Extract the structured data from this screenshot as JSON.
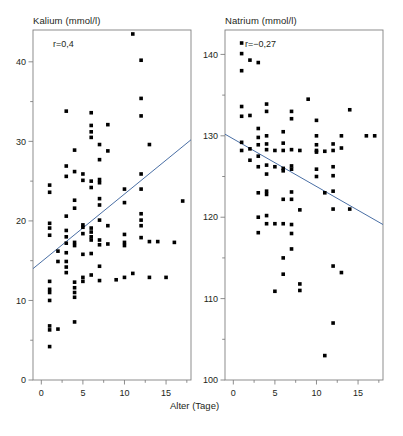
{
  "figure": {
    "width": 403,
    "height": 436,
    "background": "#ffffff",
    "marker_color": "#000000",
    "line_color": "#4a6fa5",
    "frame_color": "#808080",
    "text_color": "#231f20",
    "shared_xlabel": "Alter (Tage)"
  },
  "chart_data": [
    {
      "type": "scatter",
      "title": "Kalium (mmol/l)",
      "xlabel": "Alter (Tage)",
      "ylabel": "Kalium (mmol/l)",
      "annotation": "r=0,4",
      "correlation": 0.4,
      "xlim": [
        -1,
        18
      ],
      "ylim": [
        0,
        44
      ],
      "xticks": [
        0,
        5,
        10,
        15
      ],
      "xticklabels": [
        "0",
        "5",
        "10",
        "15"
      ],
      "xminorticks": [
        2.5,
        7.5,
        12.5,
        17.5
      ],
      "yticks": [
        0,
        10,
        20,
        30,
        40
      ],
      "yticklabels": [
        "0",
        "10",
        "20",
        "30",
        "40"
      ],
      "yminorticks": [
        5,
        15,
        25,
        35
      ],
      "grid": false,
      "legend": "none",
      "trendline": {
        "x0": -1,
        "y0": 14.0,
        "x1": 18,
        "y1": 30.2
      },
      "points": [
        [
          1,
          4.2
        ],
        [
          1,
          6.3
        ],
        [
          1,
          6.8
        ],
        [
          1,
          10.0
        ],
        [
          1,
          11.0
        ],
        [
          1,
          11.4
        ],
        [
          1,
          12.4
        ],
        [
          1,
          18.2
        ],
        [
          1,
          19.1
        ],
        [
          1,
          19.7
        ],
        [
          1,
          23.6
        ],
        [
          1,
          24.5
        ],
        [
          2,
          6.4
        ],
        [
          2,
          14.9
        ],
        [
          2,
          16.2
        ],
        [
          3,
          13.5
        ],
        [
          3,
          14.2
        ],
        [
          3,
          14.9
        ],
        [
          3,
          16.0
        ],
        [
          3,
          17.2
        ],
        [
          3,
          18.0
        ],
        [
          3,
          18.8
        ],
        [
          3,
          20.6
        ],
        [
          3,
          25.6
        ],
        [
          3,
          26.9
        ],
        [
          3,
          33.8
        ],
        [
          4,
          7.3
        ],
        [
          4,
          10.4
        ],
        [
          4,
          11.0
        ],
        [
          4,
          11.6
        ],
        [
          4,
          12.3
        ],
        [
          4,
          16.9
        ],
        [
          4,
          17.3
        ],
        [
          4,
          21.6
        ],
        [
          4,
          22.6
        ],
        [
          4,
          26.2
        ],
        [
          4,
          28.9
        ],
        [
          5,
          12.4
        ],
        [
          5,
          12.9
        ],
        [
          5,
          15.8
        ],
        [
          5,
          18.4
        ],
        [
          5,
          19.2
        ],
        [
          5,
          19.5
        ],
        [
          5,
          25.1
        ],
        [
          5,
          25.9
        ],
        [
          6,
          13.2
        ],
        [
          6,
          15.9
        ],
        [
          6,
          17.6
        ],
        [
          6,
          18.0
        ],
        [
          6,
          18.6
        ],
        [
          6,
          19.1
        ],
        [
          6,
          24.2
        ],
        [
          6,
          25.0
        ],
        [
          6,
          33.6
        ],
        [
          6,
          31.2
        ],
        [
          6,
          32.0
        ],
        [
          6,
          30.5
        ],
        [
          7,
          12.5
        ],
        [
          7,
          14.3
        ],
        [
          7,
          17.0
        ],
        [
          7,
          17.6
        ],
        [
          7,
          20.1
        ],
        [
          7,
          22.0
        ],
        [
          7,
          22.8
        ],
        [
          7,
          24.8
        ],
        [
          7,
          25.2
        ],
        [
          7,
          27.7
        ],
        [
          7,
          29.6
        ],
        [
          8,
          17.1
        ],
        [
          8,
          19.4
        ],
        [
          8,
          28.8
        ],
        [
          8,
          32.1
        ],
        [
          9,
          12.6
        ],
        [
          10,
          12.9
        ],
        [
          10,
          16.9
        ],
        [
          10,
          17.3
        ],
        [
          10,
          18.3
        ],
        [
          10,
          22.3
        ],
        [
          10,
          24.0
        ],
        [
          11,
          13.4
        ],
        [
          11,
          43.5
        ],
        [
          12,
          17.9
        ],
        [
          12,
          19.4
        ],
        [
          12,
          20.1
        ],
        [
          12,
          20.9
        ],
        [
          12,
          24.0
        ],
        [
          12,
          25.9
        ],
        [
          12,
          33.2
        ],
        [
          12,
          35.4
        ],
        [
          12,
          40.2
        ],
        [
          13,
          12.9
        ],
        [
          13,
          17.4
        ],
        [
          13,
          29.6
        ],
        [
          14,
          17.4
        ],
        [
          15,
          12.9
        ],
        [
          16,
          17.3
        ],
        [
          17,
          22.5
        ]
      ]
    },
    {
      "type": "scatter",
      "title": "Natrium (mmol/l)",
      "xlabel": "Alter (Tage)",
      "ylabel": "Natrium (mmol/l)",
      "annotation": "r=−0,27",
      "correlation": -0.27,
      "xlim": [
        -1,
        18
      ],
      "ylim": [
        100,
        143
      ],
      "xticks": [
        0,
        5,
        10,
        15
      ],
      "xticklabels": [
        "0",
        "5",
        "10",
        "15"
      ],
      "xminorticks": [
        2.5,
        7.5,
        12.5,
        17.5
      ],
      "yticks": [
        100,
        110,
        120,
        130,
        140
      ],
      "yticklabels": [
        "100",
        "110",
        "120",
        "130",
        "140"
      ],
      "yminorticks": [
        105,
        115,
        125,
        135
      ],
      "grid": false,
      "legend": "none",
      "trendline": {
        "x0": -1,
        "y0": 130.2,
        "x1": 18,
        "y1": 119.1
      },
      "points": [
        [
          1,
          141.4
        ],
        [
          1,
          140.1
        ],
        [
          1,
          138.0
        ],
        [
          1,
          133.6
        ],
        [
          1,
          132.4
        ],
        [
          1,
          129.2
        ],
        [
          1,
          128.2
        ],
        [
          2,
          139.3
        ],
        [
          2,
          132.5
        ],
        [
          2,
          128.4
        ],
        [
          2,
          127.0
        ],
        [
          3,
          139.0
        ],
        [
          3,
          130.9
        ],
        [
          3,
          129.8
        ],
        [
          3,
          128.9
        ],
        [
          3,
          127.5
        ],
        [
          3,
          126.2
        ],
        [
          3,
          123.0
        ],
        [
          3,
          120.0
        ],
        [
          3,
          118.1
        ],
        [
          4,
          133.9
        ],
        [
          4,
          133.0
        ],
        [
          4,
          130.0
        ],
        [
          4,
          129.0
        ],
        [
          4,
          128.3
        ],
        [
          4,
          126.4
        ],
        [
          4,
          125.3
        ],
        [
          4,
          123.2
        ],
        [
          4,
          122.8
        ],
        [
          4,
          120.2
        ],
        [
          4,
          119.2
        ],
        [
          5,
          128.2
        ],
        [
          5,
          126.2
        ],
        [
          5,
          119.2
        ],
        [
          5,
          110.9
        ],
        [
          6,
          130.5
        ],
        [
          6,
          129.1
        ],
        [
          6,
          128.2
        ],
        [
          6,
          126.0
        ],
        [
          6,
          125.7
        ],
        [
          6,
          122.2
        ],
        [
          6,
          119.2
        ],
        [
          6,
          115.0
        ],
        [
          6,
          113.0
        ],
        [
          7,
          133.0
        ],
        [
          7,
          132.1
        ],
        [
          7,
          128.3
        ],
        [
          7,
          126.3
        ],
        [
          7,
          125.9
        ],
        [
          7,
          123.1
        ],
        [
          7,
          122.2
        ],
        [
          7,
          119.1
        ],
        [
          7,
          118.0
        ],
        [
          7,
          116.1
        ],
        [
          8,
          128.2
        ],
        [
          8,
          120.9
        ],
        [
          8,
          111.8
        ],
        [
          8,
          111.0
        ],
        [
          9,
          134.5
        ],
        [
          10,
          131.9
        ],
        [
          10,
          130.0
        ],
        [
          10,
          128.9
        ],
        [
          10,
          128.0
        ],
        [
          10,
          125.9
        ],
        [
          10,
          125.0
        ],
        [
          10,
          128.2
        ],
        [
          11,
          128.1
        ],
        [
          11,
          123.0
        ],
        [
          11,
          103.0
        ],
        [
          12,
          129.0
        ],
        [
          12,
          128.2
        ],
        [
          12,
          126.2
        ],
        [
          12,
          125.1
        ],
        [
          12,
          123.2
        ],
        [
          12,
          121.0
        ],
        [
          12,
          114.0
        ],
        [
          12,
          107.0
        ],
        [
          13,
          130.0
        ],
        [
          13,
          128.5
        ],
        [
          13,
          113.2
        ],
        [
          14,
          133.2
        ],
        [
          14,
          121.0
        ],
        [
          16,
          130.0
        ],
        [
          17,
          130.0
        ]
      ]
    }
  ]
}
